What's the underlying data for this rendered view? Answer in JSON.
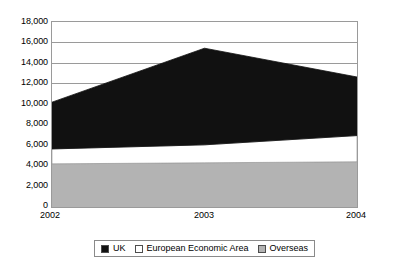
{
  "chart_data": {
    "type": "area",
    "subtype": "stacked-area",
    "title": "",
    "xlabel": "",
    "ylabel": "",
    "categories": [
      "2002",
      "2003",
      "2004"
    ],
    "x": [
      2002,
      2003,
      2004
    ],
    "ylim": [
      0,
      18000
    ],
    "y_ticks": [
      0,
      2000,
      4000,
      6000,
      8000,
      10000,
      12000,
      14000,
      16000,
      18000
    ],
    "y_tick_labels": [
      "0",
      "2,000",
      "4,000",
      "6,000",
      "8,000",
      "10,000",
      "12,000",
      "14,000",
      "16,000",
      "18,000"
    ],
    "x_tick_labels": [
      "2002",
      "2003",
      "2004"
    ],
    "grid": true,
    "grid_axis": "y",
    "legend_position": "bottom",
    "stack_order_bottom_to_top": [
      "Overseas",
      "European Economic Area",
      "UK"
    ],
    "series": [
      {
        "name": "UK",
        "color": "#111111",
        "values": [
          4550,
          9400,
          5700
        ]
      },
      {
        "name": "European Economic Area",
        "color": "#ffffff",
        "values": [
          1450,
          1750,
          2550
        ]
      },
      {
        "name": "Overseas",
        "color": "#b3b3b3",
        "values": [
          4200,
          4300,
          4400
        ]
      }
    ],
    "cumulative_tops": {
      "Overseas": [
        4200,
        4300,
        4400
      ],
      "European Economic Area": [
        5650,
        6050,
        6950
      ],
      "UK": [
        10200,
        15450,
        12650
      ]
    }
  },
  "legend": {
    "items": [
      {
        "label": "UK",
        "swatch": "legend-swatch-uk",
        "color": "#111111"
      },
      {
        "label": "European Economic Area",
        "swatch": "legend-swatch-eea",
        "color": "#ffffff"
      },
      {
        "label": "Overseas",
        "swatch": "legend-swatch-overseas",
        "color": "#b3b3b3"
      }
    ]
  }
}
